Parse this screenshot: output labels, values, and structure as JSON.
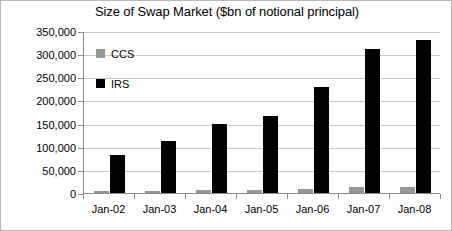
{
  "chart_data": {
    "type": "bar",
    "title": "Size of Swap Market ($bn of notional principal)",
    "xlabel": "",
    "ylabel": "",
    "categories": [
      "Jan-02",
      "Jan-03",
      "Jan-04",
      "Jan-05",
      "Jan-06",
      "Jan-07",
      "Jan-08"
    ],
    "series": [
      {
        "name": "CCS",
        "color": "#969696",
        "values": [
          4000,
          5000,
          6000,
          7000,
          9000,
          12000,
          13000
        ]
      },
      {
        "name": "IRS",
        "color": "#000000",
        "values": [
          82000,
          112000,
          150000,
          167000,
          230000,
          311000,
          330000
        ]
      }
    ],
    "ylim": [
      0,
      350000
    ],
    "ytick_values": [
      0,
      50000,
      100000,
      150000,
      200000,
      250000,
      300000,
      350000
    ],
    "ytick_labels": [
      "0",
      "50,000",
      "100,000",
      "150,000",
      "200,000",
      "250,000",
      "300,000",
      "350,000"
    ],
    "grid": true,
    "legend_position": "inside-top-left",
    "legend_entries": [
      "CCS",
      "IRS"
    ]
  }
}
